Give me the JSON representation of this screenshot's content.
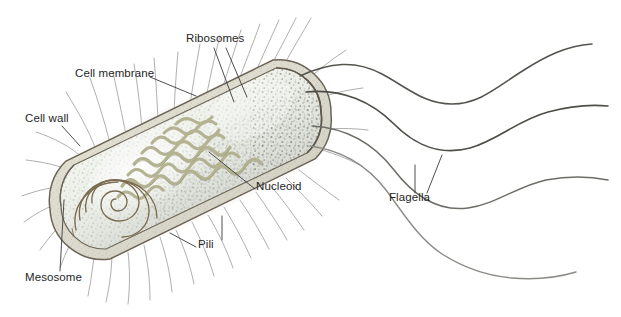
{
  "figure": {
    "background_color": "#ffffff",
    "cell_type": "rod-shaped bacillus bacterium",
    "orientation": "diagonal, long axis from lower-left to upper-right"
  },
  "labels": {
    "ribosomes": "Ribosomes",
    "cell_membrane": "Cell membrane",
    "cell_wall": "Cell wall",
    "nucleoid": "Nucleoid",
    "mesosome": "Mesosome",
    "pili": "Pili",
    "flagella": "Flagella"
  },
  "label_positions": {
    "ribosomes": {
      "x": 186,
      "y": 39
    },
    "cell_membrane": {
      "x": 75,
      "y": 74
    },
    "cell_wall": {
      "x": 25,
      "y": 119
    },
    "nucleoid": {
      "x": 256,
      "y": 186
    },
    "mesosome": {
      "x": 25,
      "y": 277
    },
    "pili": {
      "x": 198,
      "y": 244
    },
    "flagella": {
      "x": 389,
      "y": 197
    }
  },
  "colors": {
    "outline": "#6b6455",
    "cell_wall_fill": "#dcd9c9",
    "cytoplasm_light": "#f2f3ec",
    "cytoplasm_pale": "#e8eee9",
    "cytoplasm_grey": "#cfd2cb",
    "nucleoid_strand": "#b2b191",
    "ribosome_dot": "#4a4a42",
    "mesosome_line": "#7a6c50",
    "pili_stroke": "#8e8e90",
    "flagella_stroke": "#5a5a58",
    "leader_line": "#3a3a3a",
    "text": "#262626"
  },
  "structures": [
    {
      "name": "cell-wall",
      "description": "outer rod-shaped boundary, tan-olive outline"
    },
    {
      "name": "cell-membrane",
      "description": "inner boundary just inside the cell wall"
    },
    {
      "name": "cytoplasm",
      "description": "pale blue-green interior with dense dark speckling"
    },
    {
      "name": "nucleoid",
      "description": "tangled olive DNA strand mass in the cell centre"
    },
    {
      "name": "ribosomes",
      "description": "numerous small dark dots throughout the cytoplasm"
    },
    {
      "name": "mesosome",
      "description": "spiral membrane infolding at the lower-left pole"
    },
    {
      "name": "pili",
      "description": "many short fine hair-like projections around the cell"
    },
    {
      "name": "flagella",
      "description": "four long wavy whip-like appendages from the right pole"
    }
  ],
  "counts": {
    "flagella": 4,
    "pili_approx": 40
  }
}
